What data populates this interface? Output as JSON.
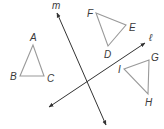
{
  "diagram": {
    "type": "geometry-transformations",
    "colors": {
      "line": "#333333",
      "triangle": "#9a9a9a",
      "label": "#3a3a3a",
      "background": "#ffffff"
    },
    "lines": [
      {
        "id": "m",
        "label": "m",
        "from": [
          106,
          125
        ],
        "to": [
          57,
          13
        ],
        "arrows": "both"
      },
      {
        "id": "l",
        "label": "ℓ",
        "from": [
          49,
          107
        ],
        "to": [
          145,
          43
        ],
        "arrows": "both"
      }
    ],
    "triangles": [
      {
        "id": "ABC",
        "vertices": {
          "A": [
            33,
            45
          ],
          "B": [
            20,
            76
          ],
          "C": [
            44,
            76
          ]
        }
      },
      {
        "id": "DEF",
        "vertices": {
          "D": [
            108,
            46
          ],
          "E": [
            126,
            25
          ],
          "F": [
            96,
            13
          ]
        }
      },
      {
        "id": "GHI",
        "vertices": {
          "G": [
            149,
            60
          ],
          "H": [
            148,
            94
          ],
          "I": [
            124,
            69
          ]
        }
      }
    ],
    "labels": {
      "A": "A",
      "B": "B",
      "C": "C",
      "D": "D",
      "E": "E",
      "F": "F",
      "G": "G",
      "H": "H",
      "I": "I",
      "m": "m",
      "l": "ℓ"
    }
  }
}
